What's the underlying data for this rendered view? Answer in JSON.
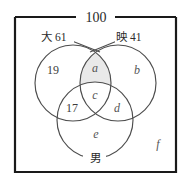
{
  "figure": {
    "title_symbol": "venn-diagram-three-sets",
    "universe": {
      "label": "100"
    },
    "sets": [
      {
        "key": "left",
        "name": "大",
        "count": "61",
        "label": "大 61"
      },
      {
        "key": "right",
        "name": "映",
        "count": "41",
        "label": "映 41"
      },
      {
        "key": "bottom",
        "name": "男",
        "count": "",
        "label": "男"
      }
    ],
    "regions": [
      {
        "key": "left_only",
        "label": "19",
        "kind": "number",
        "shaded": false
      },
      {
        "key": "left_right_only",
        "label": "a",
        "kind": "variable",
        "shaded": true
      },
      {
        "key": "right_only",
        "label": "b",
        "kind": "variable",
        "shaded": false
      },
      {
        "key": "all_three",
        "label": "c",
        "kind": "variable",
        "shaded": false
      },
      {
        "key": "right_bottom_only",
        "label": "d",
        "kind": "variable",
        "shaded": false
      },
      {
        "key": "left_bottom_only",
        "label": "17",
        "kind": "number",
        "shaded": false
      },
      {
        "key": "bottom_only",
        "label": "e",
        "kind": "variable",
        "shaded": false
      },
      {
        "key": "outside_all",
        "label": "f",
        "kind": "variable",
        "shaded": false
      }
    ],
    "colors": {
      "shade": "#e9e9e9",
      "circle_stroke": "#4d4d4d",
      "rect_stroke": "#1a1a1a",
      "text": "#3d3d3d",
      "background": "#ffffff"
    }
  }
}
